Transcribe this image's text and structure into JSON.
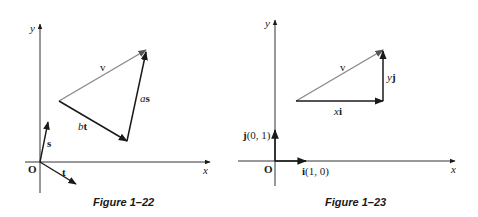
{
  "figures": [
    {
      "id": "fig-1-22",
      "caption": "Figure 1–22",
      "axes": {
        "x_label": "x",
        "y_label": "y",
        "origin_label": "O"
      },
      "vectors": {
        "s": {
          "label": "s"
        },
        "t": {
          "label": "t"
        },
        "v": {
          "label": "v"
        },
        "as": {
          "label_coef": "a",
          "label_vec": "s"
        },
        "bt": {
          "label_coef": "b",
          "label_vec": "t"
        }
      }
    },
    {
      "id": "fig-1-23",
      "caption": "Figure 1–23",
      "axes": {
        "x_label": "x",
        "y_label": "y",
        "origin_label": "O"
      },
      "vectors": {
        "i": {
          "label": "i",
          "coords": "(1, 0)"
        },
        "j": {
          "label": "j",
          "coords": "(0, 1)"
        },
        "v": {
          "label": "v"
        },
        "xi": {
          "label_coef": "x",
          "label_vec": "i"
        },
        "yj": {
          "label_coef": "y",
          "label_vec": "j"
        }
      }
    }
  ],
  "colors": {
    "ink": "#1a1a1a",
    "v_line": "#8a8a8a",
    "axis": "#333333"
  }
}
